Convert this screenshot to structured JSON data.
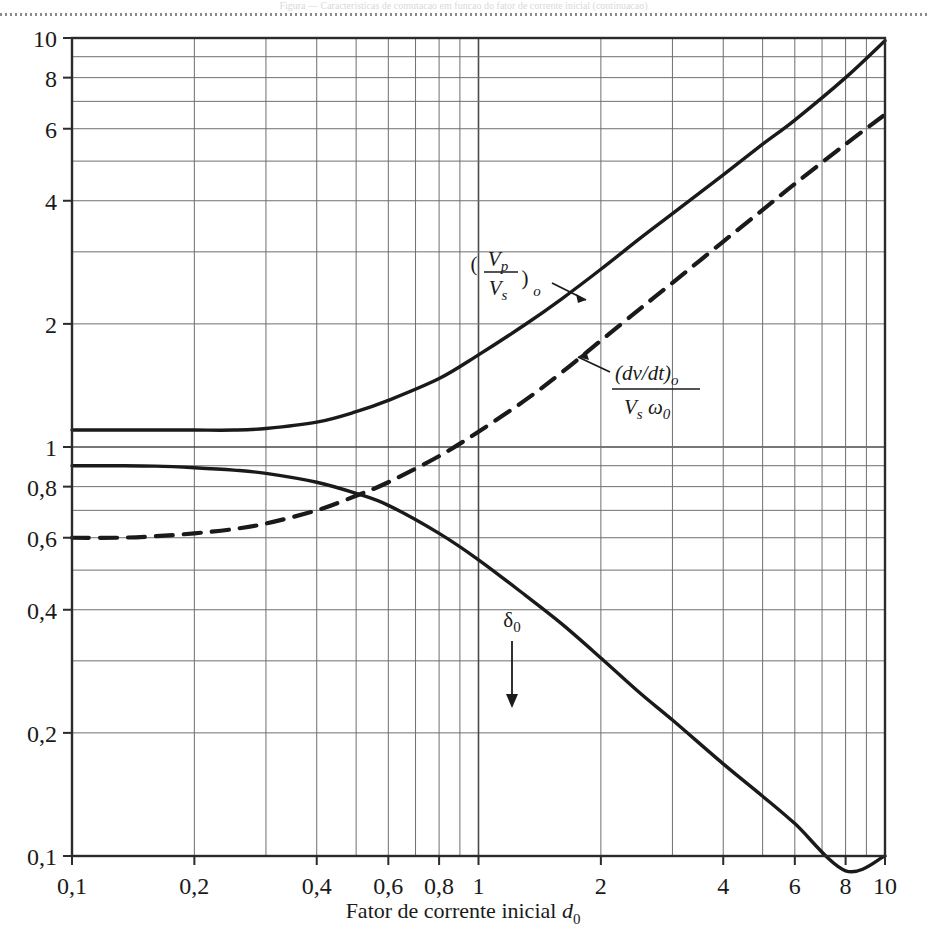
{
  "page": {
    "header_text": "Figura — Caracteristicas de comutacao em funcao do fator de corrente inicial (continuacao)"
  },
  "chart_data": {
    "type": "line",
    "title": "",
    "subtitle": "",
    "xlabel": "Fator de corrente inicial d",
    "xlabel_sub": "0",
    "ylabel": "",
    "xscale": "log",
    "yscale": "log",
    "xlim": [
      0.1,
      10
    ],
    "ylim": [
      0.1,
      10
    ],
    "grid": "on",
    "grid_style": "log minor gridlines at 1-10 per decade",
    "legend_position": "inline-annotations",
    "x_ticks": [
      "0,1",
      "0,2",
      "0,4",
      "0,6",
      "0,8",
      "1",
      "2",
      "4",
      "6",
      "8",
      "10"
    ],
    "x_tick_values": [
      0.1,
      0.2,
      0.4,
      0.6,
      0.8,
      1,
      2,
      4,
      6,
      8,
      10
    ],
    "y_ticks": [
      "0,1",
      "0,2",
      "0,4",
      "0,6",
      "0,8",
      "1",
      "2",
      "4",
      "6",
      "8",
      "10"
    ],
    "y_tick_values": [
      0.1,
      0.2,
      0.4,
      0.6,
      0.8,
      1,
      2,
      4,
      6,
      8,
      10
    ],
    "series": [
      {
        "name": "(Vp/Vs)o",
        "label_numerator": "V",
        "label_numerator_sub": "p",
        "label_denominator": "V",
        "label_denominator_sub": "s",
        "label_paren_sub": "o",
        "style": "solid",
        "color": "#1a1a1a",
        "x": [
          0.1,
          0.13,
          0.16,
          0.2,
          0.25,
          0.3,
          0.4,
          0.5,
          0.6,
          0.8,
          1.0,
          1.3,
          1.6,
          2.0,
          2.5,
          3.0,
          4.0,
          5.0,
          6.0,
          8.0,
          10.0
        ],
        "values": [
          1.1,
          1.1,
          1.1,
          1.1,
          1.1,
          1.11,
          1.15,
          1.22,
          1.3,
          1.47,
          1.68,
          1.99,
          2.3,
          2.72,
          3.24,
          3.72,
          4.63,
          5.5,
          6.3,
          8.0,
          9.85
        ]
      },
      {
        "name": "(dv/dt)o / (Vs w0)",
        "label_numerator": "(dv/dt)",
        "label_numerator_sub": "o",
        "label_denominator": "V",
        "label_denominator_sub": "s",
        "label_denominator_2": "ω",
        "label_denominator_2_sub": "0",
        "style": "dashed",
        "color": "#1a1a1a",
        "x": [
          0.1,
          0.13,
          0.16,
          0.2,
          0.25,
          0.3,
          0.4,
          0.5,
          0.6,
          0.8,
          1.0,
          1.3,
          1.6,
          2.0,
          2.5,
          3.0,
          4.0,
          5.0,
          6.0,
          8.0,
          10.0
        ],
        "values": [
          0.6,
          0.6,
          0.605,
          0.615,
          0.63,
          0.65,
          0.7,
          0.76,
          0.82,
          0.95,
          1.09,
          1.3,
          1.52,
          1.82,
          2.18,
          2.52,
          3.18,
          3.8,
          4.4,
          5.5,
          6.5
        ]
      },
      {
        "name": "δ₀",
        "label": "δ",
        "label_sub": "0",
        "style": "solid",
        "color": "#1a1a1a",
        "x": [
          0.1,
          0.13,
          0.16,
          0.2,
          0.25,
          0.3,
          0.4,
          0.5,
          0.6,
          0.8,
          1.0,
          1.3,
          1.6,
          2.0,
          2.5,
          3.0,
          4.0,
          5.0,
          6.0,
          8.0,
          10.0
        ],
        "values": [
          0.9,
          0.9,
          0.898,
          0.89,
          0.878,
          0.862,
          0.82,
          0.77,
          0.72,
          0.615,
          0.53,
          0.435,
          0.37,
          0.305,
          0.25,
          0.215,
          0.168,
          0.14,
          0.12,
          0.092,
          0.1
        ]
      }
    ],
    "annotations": [
      {
        "name": "vp-vs-annotation",
        "text": "(Vp/Vs)o",
        "x": 1.05,
        "y": 2.62,
        "arrow": "points down-right to solid upper curve"
      },
      {
        "name": "dvdt-annotation",
        "text": "(dv/dt)o / Vs w0",
        "x": 2.2,
        "y": 1.42,
        "arrow": "points left to dashed curve"
      },
      {
        "name": "delta0-annotation",
        "text": "δ₀",
        "x": 1.3,
        "y": 0.38,
        "arrow": "points down to solid lower curve"
      }
    ]
  },
  "axis": {
    "x_title_prefix": "Fator de corrente inicial ",
    "x_title_symbol": "d",
    "x_title_symbol_sub": "0"
  }
}
